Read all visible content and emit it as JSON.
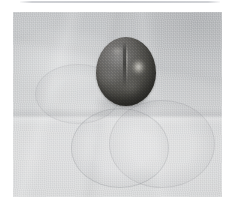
{
  "page": {
    "background_color": "#ffffff",
    "width": 238,
    "height": 206,
    "top_rule_color": "#cdcfd3"
  },
  "photo": {
    "type": "photograph",
    "subject": "single dark round fruit resting on a light gray cloth",
    "frame": {
      "x": 13,
      "y": 12,
      "width": 209,
      "height": 185
    },
    "background_surface": {
      "name": "cloth-surface",
      "description": "light gray woven fabric with soft creases and a lighter lower band",
      "base_color": "#cdcfd0",
      "shadow_color": "#aeb0b4",
      "highlight_color": "#e2e3e4"
    },
    "subject_object": {
      "name": "dark-round-fruit",
      "shape": "oval",
      "bounds": {
        "x": 96,
        "y": 37,
        "width": 60,
        "height": 69
      },
      "skin_color": "#55544f",
      "shadow_color": "#393834",
      "highlight_color": "#f2f0ea",
      "features": [
        "vertical suture crease down the center",
        "specular highlight on the right shoulder",
        "soft contact shadow at the base"
      ]
    },
    "impressions": [
      {
        "name": "ghost-ring-lower-left",
        "x": 71,
        "y": 108,
        "width": 96,
        "height": 78
      },
      {
        "name": "ghost-ring-lower-right",
        "x": 109,
        "y": 100,
        "width": 104,
        "height": 86
      },
      {
        "name": "ghost-ring-upper-left",
        "x": 35,
        "y": 64,
        "width": 84,
        "height": 58
      }
    ]
  }
}
